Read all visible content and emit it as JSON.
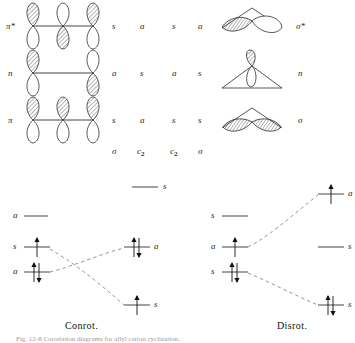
{
  "figure": {
    "title_caption": "Fig. 12-8   Correlation diagrams for allyl cation cyclization.",
    "left_panel_label": "Conrot.",
    "right_panel_label": "Disrot."
  },
  "orbitals": {
    "left_column": {
      "system": "allyl",
      "rows": [
        {
          "name": "pi-star",
          "label": "π*",
          "sym_sigma": "s",
          "sym_c2": "a",
          "lobes": [
            {
              "top_shaded": true,
              "bottom_shaded": false
            },
            {
              "top_shaded": false,
              "bottom_shaded": true
            },
            {
              "top_shaded": true,
              "bottom_shaded": false
            }
          ]
        },
        {
          "name": "n",
          "label": "n",
          "sym_sigma": "a",
          "sym_c2": "s",
          "lobes": [
            {
              "top_shaded": true,
              "bottom_shaded": false
            },
            {
              "top_shaded": false,
              "bottom_shaded": true
            }
          ]
        },
        {
          "name": "pi",
          "label": "π",
          "sym_sigma": "s",
          "sym_c2": "a",
          "lobes": [
            {
              "top_shaded": true,
              "bottom_shaded": false
            },
            {
              "top_shaded": true,
              "bottom_shaded": false
            },
            {
              "top_shaded": true,
              "bottom_shaded": false
            }
          ]
        }
      ],
      "axis_headers": [
        "σ",
        "C₂"
      ]
    },
    "right_column": {
      "system": "cyclopropyl",
      "rows": [
        {
          "name": "sigma-star",
          "label": "σ*",
          "sym_c2": "s",
          "sym_sigma": "a"
        },
        {
          "name": "n",
          "label": "n",
          "sym_c2": "a",
          "sym_sigma": "s"
        },
        {
          "name": "sigma",
          "label": "σ",
          "sym_c2": "s",
          "sym_sigma": "s"
        }
      ],
      "axis_headers": [
        "C₂",
        "σ"
      ]
    }
  },
  "correlation": {
    "conrot": {
      "panel_label": "Conrot.",
      "left_levels": [
        {
          "label": "a",
          "electrons": 0,
          "energy_rank": 2,
          "name": "conrot-left-a-empty"
        },
        {
          "label": "s",
          "electrons": 1,
          "energy_rank": 3,
          "name": "conrot-left-s"
        },
        {
          "label": "a",
          "electrons": 2,
          "energy_rank": 4,
          "name": "conrot-left-a"
        }
      ],
      "right_levels": [
        {
          "label": "a",
          "electrons": 2,
          "energy_rank": 3,
          "name": "conrot-right-a"
        },
        {
          "label": "s",
          "electrons": 1,
          "energy_rank": 5,
          "name": "conrot-right-s"
        }
      ],
      "top_center_level": {
        "label": "s",
        "electrons": 0,
        "name": "conrot-top-s"
      }
    },
    "disrot": {
      "panel_label": "Disrot.",
      "left_levels": [
        {
          "label": "s",
          "electrons": 0,
          "energy_rank": 2,
          "name": "disrot-left-s-empty"
        },
        {
          "label": "a",
          "electrons": 1,
          "energy_rank": 3,
          "name": "disrot-left-a"
        },
        {
          "label": "s",
          "electrons": 2,
          "energy_rank": 4,
          "name": "disrot-left-s"
        }
      ],
      "right_levels": [
        {
          "label": "a",
          "electrons": 1,
          "energy_rank": 1,
          "name": "disrot-right-a"
        },
        {
          "label": "s",
          "electrons": 0,
          "energy_rank": 3,
          "name": "disrot-right-s-empty"
        },
        {
          "label": "s",
          "electrons": 2,
          "energy_rank": 5,
          "name": "disrot-right-s"
        }
      ]
    }
  },
  "colors": {
    "ink": "#1a1a1a",
    "line": "#333333",
    "dashed": "#777777",
    "label": "#2a2a2a",
    "caption_faint": "#9a9a9a",
    "background": "#ffffff"
  }
}
